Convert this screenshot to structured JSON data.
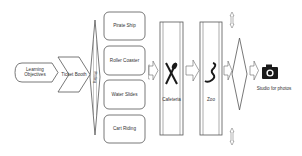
{
  "diagram": {
    "type": "flowchart",
    "nodes": {
      "start": {
        "label_line1": "Learning",
        "label_line2": "Objectives",
        "shape": "display-hexagon"
      },
      "ticket": {
        "label": "Ticket Booth",
        "shape": "chevron"
      },
      "rides": {
        "label": "Riding",
        "shape": "tall-diamond"
      },
      "ride_options": [
        {
          "label": "Pirate Ship"
        },
        {
          "label": "Roller Coaster"
        },
        {
          "label": "Water Slides"
        },
        {
          "label": "Cart Riding"
        }
      ],
      "cafeteria": {
        "label": "Cafeteria",
        "icon": "fork-knife-icon"
      },
      "zoo": {
        "label": "Zoo",
        "icon": "snake-icon"
      },
      "decision": {
        "shape": "diamond"
      },
      "studio": {
        "label": "Studio for photos",
        "icon": "camera-icon"
      }
    },
    "colors": {
      "stroke": "#555555",
      "fill": "#ffffff",
      "icon": "#1a1a1a",
      "text": "#333333"
    }
  }
}
